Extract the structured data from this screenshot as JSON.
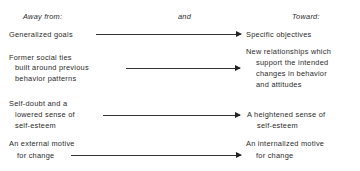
{
  "headers": {
    "left": "Away from:",
    "middle": "and",
    "right": "Toward:"
  },
  "rows": [
    {
      "from": [
        "Generalized goals"
      ],
      "to": [
        "Specific objectives"
      ]
    },
    {
      "from": [
        "Former social ties",
        "built around previous",
        "behavior patterns"
      ],
      "to": [
        "New relationships which",
        "support the intended",
        "changes in behavior",
        "and attitudes"
      ]
    },
    {
      "from": [
        "Self-doubt and a",
        "lowered sense of",
        "self-esteem"
      ],
      "to": [
        "A heightened sense of",
        "self-esteem"
      ]
    },
    {
      "from": [
        "An external motive",
        "for change"
      ],
      "to": [
        "An internalized motive",
        "for change"
      ]
    }
  ],
  "arrow_color": "#333333"
}
